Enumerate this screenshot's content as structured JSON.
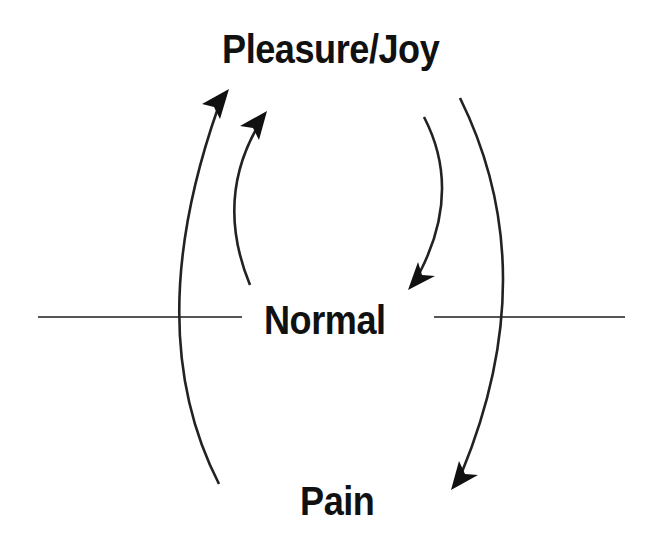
{
  "diagram": {
    "nodes": {
      "top": "Pleasure/Joy",
      "middle": "Normal",
      "bottom": "Pain"
    },
    "edges": [
      {
        "from": "Pain",
        "to": "Pleasure/Joy",
        "side": "left-outer"
      },
      {
        "from": "Normal",
        "to": "Pleasure/Joy",
        "side": "left-inner"
      },
      {
        "from": "Pleasure/Joy",
        "to": "Normal",
        "side": "right-inner"
      },
      {
        "from": "Pleasure/Joy",
        "to": "Pain",
        "side": "right-outer"
      }
    ],
    "baseline": "horizontal line through Normal",
    "colors": {
      "text": "#111111",
      "line": "#222222",
      "baseline": "#555555",
      "background": "#ffffff"
    }
  }
}
